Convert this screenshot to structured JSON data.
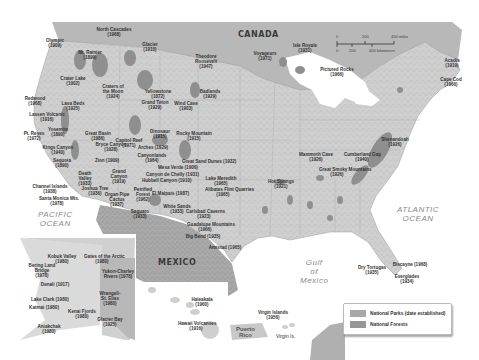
{
  "map": {
    "countries": {
      "canada": "CANADA",
      "mexico": "MEXICO"
    },
    "oceans": {
      "pacific": "PACIFIC\nOCEAN",
      "atlantic": "ATLANTIC\nOCEAN",
      "gulf": "Gulf\nof\nMexico"
    },
    "scale": {
      "miles": [
        "0",
        "200",
        "400 miles"
      ],
      "km": [
        "0",
        "200",
        "400 kilometers"
      ]
    },
    "colors": {
      "land": "#d6d6d6",
      "water": "#ffffff",
      "canada_mexico": "#b5b5b5",
      "park": "#9a9a9a",
      "forest": "#8c8c8c",
      "legend_park": "#a8a8a8",
      "legend_forest": "#969696"
    },
    "parks": [
      {
        "name": "North Cascades\n(1968)",
        "x": 114,
        "y": 30
      },
      {
        "name": "Olympic\n(1909)",
        "x": 55,
        "y": 41
      },
      {
        "name": "Glacier\n(1910)",
        "x": 150,
        "y": 45
      },
      {
        "name": "Mt. Rainier\n(1899)",
        "x": 90,
        "y": 53
      },
      {
        "name": "Theodore\nRoosevelt\n(1947)",
        "x": 206,
        "y": 57
      },
      {
        "name": "Voyageurs\n(1971)",
        "x": 265,
        "y": 54
      },
      {
        "name": "Isle Royale\n(1931)",
        "x": 305,
        "y": 46
      },
      {
        "name": "Pictured Rocks\n(1966)",
        "x": 337,
        "y": 70
      },
      {
        "name": "Acadia\n(1919)",
        "x": 452,
        "y": 61
      },
      {
        "name": "Cape Cod\n(1966)",
        "x": 451,
        "y": 80
      },
      {
        "name": "Crater Lake\n(1902)",
        "x": 73,
        "y": 79
      },
      {
        "name": "Craters of\nthe Moon\n(1924)",
        "x": 113,
        "y": 87
      },
      {
        "name": "Yellowstone\n(1872)",
        "x": 158,
        "y": 92
      },
      {
        "name": "Grand Teton\n(1929)",
        "x": 155,
        "y": 103
      },
      {
        "name": "Wind Cave\n(1903)",
        "x": 186,
        "y": 104
      },
      {
        "name": "Badlands\n(1929)",
        "x": 210,
        "y": 92
      },
      {
        "name": "Redwood\n(1968)",
        "x": 35,
        "y": 99
      },
      {
        "name": "Lava Beds\n(1925)",
        "x": 73,
        "y": 104
      },
      {
        "name": "Lassen Volcanic\n(1916)",
        "x": 47,
        "y": 115
      },
      {
        "name": "Yosemite\n(1890)",
        "x": 58,
        "y": 130
      },
      {
        "name": "Pt. Reyes\n(1972)",
        "x": 34,
        "y": 134
      },
      {
        "name": "Great Basin\n(1986)",
        "x": 98,
        "y": 134
      },
      {
        "name": "Capitol Reef\n(1971)",
        "x": 129,
        "y": 141
      },
      {
        "name": "Bryce Canyon\n(1928)",
        "x": 111,
        "y": 145
      },
      {
        "name": "Dinosaur\n(1915)",
        "x": 160,
        "y": 132
      },
      {
        "name": "Rocky Mountain\n(1915)",
        "x": 194,
        "y": 134
      },
      {
        "name": "Arches (1929)",
        "x": 153,
        "y": 148
      },
      {
        "name": "Canyonlands\n(1964)",
        "x": 152,
        "y": 156
      },
      {
        "name": "Kings Canyon\n(1940)",
        "x": 58,
        "y": 148
      },
      {
        "name": "Sequoia\n(1890)",
        "x": 62,
        "y": 161
      },
      {
        "name": "Zion (1909)",
        "x": 107,
        "y": 161
      },
      {
        "name": "Great Sand Dunes (1932)",
        "x": 200,
        "y": 162
      },
      {
        "name": "Mesa Verde (1906)",
        "x": 176,
        "y": 168
      },
      {
        "name": "Death\nValley\n(1933)",
        "x": 85,
        "y": 174
      },
      {
        "name": "Grand\nCanyon\n(1919)",
        "x": 119,
        "y": 172
      },
      {
        "name": "Canyon de Chelly (1931)",
        "x": 164,
        "y": 175
      },
      {
        "name": "Hubbell Canyon (1910)",
        "x": 160,
        "y": 181
      },
      {
        "name": "Lake Meredith\n(1965)",
        "x": 221,
        "y": 179
      },
      {
        "name": "Alibates Flint Quarries\n(1965)",
        "x": 223,
        "y": 190
      },
      {
        "name": "Joshua Tree\n(1936)",
        "x": 95,
        "y": 189
      },
      {
        "name": "Channel Islands\n(1938)",
        "x": 50,
        "y": 187
      },
      {
        "name": "Santa Monica Mts.\n(1978)",
        "x": 57,
        "y": 199
      },
      {
        "name": "Organ Pipe\nCactus\n(1937)",
        "x": 117,
        "y": 195
      },
      {
        "name": "Petrified\nForest\n(1962)",
        "x": 143,
        "y": 190
      },
      {
        "name": "El Malpais (1987)",
        "x": 170,
        "y": 194
      },
      {
        "name": "White Sands\n(1933)",
        "x": 177,
        "y": 207
      },
      {
        "name": "Saguaro\n(1933)",
        "x": 140,
        "y": 212
      },
      {
        "name": "Carlsbad Caverns\n(1923)",
        "x": 204,
        "y": 212
      },
      {
        "name": "Guadalupe Mountains\n(1966)",
        "x": 205,
        "y": 225
      },
      {
        "name": "Big Bend (1935)",
        "x": 203,
        "y": 237
      },
      {
        "name": "Amistad (1965)",
        "x": 225,
        "y": 248
      },
      {
        "name": "Hot Springs\n(1921)",
        "x": 281,
        "y": 182
      },
      {
        "name": "Mammoth Cave\n(1926)",
        "x": 316,
        "y": 155
      },
      {
        "name": "Great Smoky Mountains\n(1926)",
        "x": 337,
        "y": 170
      },
      {
        "name": "Cumberland Gap\n(1940)",
        "x": 362,
        "y": 155
      },
      {
        "name": "Shenandoah\n(1926)",
        "x": 395,
        "y": 140
      },
      {
        "name": "Dry Tortugas\n(1935)",
        "x": 372,
        "y": 268
      },
      {
        "name": "Biscayne (1968)",
        "x": 410,
        "y": 265
      },
      {
        "name": "Everglades\n(1934)",
        "x": 407,
        "y": 277
      }
    ],
    "alaska": [
      {
        "name": "Kobuk Valley\n(1980)",
        "x": 62,
        "y": 257
      },
      {
        "name": "Gates of the Arctic\n(1980)",
        "x": 102,
        "y": 257
      },
      {
        "name": "Bering Land\nBridge\n(1978)",
        "x": 42,
        "y": 266
      },
      {
        "name": "Yukon-Charley\nRivers (1978)",
        "x": 118,
        "y": 272
      },
      {
        "name": "Denali (1917)",
        "x": 55,
        "y": 285
      },
      {
        "name": "Wrangell-\nSt. Elias\n(1980)",
        "x": 110,
        "y": 294
      },
      {
        "name": "Lake Clark (1980)",
        "x": 49,
        "y": 300
      },
      {
        "name": "Katmai (1980)",
        "x": 44,
        "y": 308
      },
      {
        "name": "Kenai Fjords\n(1980)",
        "x": 82,
        "y": 312
      },
      {
        "name": "Glacier Bay\n(1925)",
        "x": 110,
        "y": 320
      },
      {
        "name": "Aniakchak\n(1980)",
        "x": 49,
        "y": 327
      }
    ],
    "hawaii": [
      {
        "name": "Haleakala\n(1960)",
        "x": 202,
        "y": 300
      },
      {
        "name": "Hawaii Volcanoes\n(1916)",
        "x": 196,
        "y": 324
      }
    ],
    "caribbean": {
      "puerto_rico": "Puerto\nRico",
      "virgin_islands_label": "Virgin Is.",
      "parks": [
        {
          "name": "Virgin Islands\n(1956)",
          "x": 273,
          "y": 313
        }
      ]
    }
  },
  "legend": {
    "items": [
      {
        "label": "National Parks (date established)",
        "color": "#a8a8a8"
      },
      {
        "label": "National Forests",
        "color": "#969696"
      }
    ]
  }
}
